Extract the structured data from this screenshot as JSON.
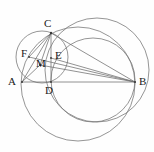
{
  "figure": {
    "type": "geometry-diagram",
    "width": 154,
    "height": 152,
    "background_color": "#fefefe",
    "stroke_color": "#7a7a7a",
    "label_color": "#1a1a1a"
  },
  "points": [
    {
      "id": "A",
      "label": "A",
      "x": 22,
      "y": 82,
      "label_x": 8,
      "label_y": 76
    },
    {
      "id": "B",
      "label": "B",
      "x": 135,
      "y": 82,
      "label_x": 139,
      "label_y": 76
    },
    {
      "id": "C",
      "label": "C",
      "x": 51,
      "y": 33,
      "label_x": 44,
      "label_y": 18
    },
    {
      "id": "D",
      "label": "D",
      "x": 51,
      "y": 82,
      "label_x": 45,
      "label_y": 85
    },
    {
      "id": "E",
      "label": "E",
      "x": 51,
      "y": 58,
      "label_x": 55,
      "label_y": 50
    },
    {
      "id": "F",
      "label": "F",
      "x": 29,
      "y": 57,
      "label_x": 21,
      "label_y": 48
    },
    {
      "id": "M",
      "label": "M",
      "x": 40,
      "y": 65,
      "label_x": 36,
      "label_y": 58
    }
  ],
  "segments": [
    {
      "name": "segment-AB",
      "from": "A",
      "to": "B"
    },
    {
      "name": "segment-AC",
      "from": "A",
      "to": "C"
    },
    {
      "name": "segment-CB",
      "from": "C",
      "to": "B"
    },
    {
      "name": "segment-CD",
      "from": "C",
      "to": "D"
    },
    {
      "name": "segment-AM",
      "from": "A",
      "to": "M"
    },
    {
      "name": "segment-MB",
      "from": "M",
      "to": "B"
    },
    {
      "name": "segment-FB",
      "from": "F",
      "to": "B"
    },
    {
      "name": "segment-EB",
      "from": "E",
      "to": "B"
    },
    {
      "name": "segment-CM",
      "from": "C",
      "to": "M"
    },
    {
      "name": "segment-CF",
      "from": "C",
      "to": "F"
    }
  ],
  "circles": [
    {
      "name": "large-circle-through-C-and-B",
      "cx": 97,
      "cy": 70,
      "r": 52,
      "note": "outer large circle passing near C and through B"
    },
    {
      "name": "inner-circle-through-C-D-B",
      "cx": 93,
      "cy": 80,
      "r": 42,
      "note": "middle circle through C and B"
    },
    {
      "name": "circle-through-A-and-B",
      "cx": 78,
      "cy": 84,
      "r": 57,
      "note": "large lower circle through A and B"
    },
    {
      "name": "small-circle-through-A-F-M-C",
      "cx": 42,
      "cy": 57,
      "r": 26,
      "note": "small circle through A, F, M and C"
    }
  ],
  "labels_order": [
    "C",
    "F",
    "E",
    "M",
    "A",
    "D",
    "B"
  ]
}
